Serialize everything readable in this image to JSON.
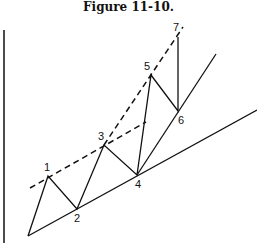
{
  "figure": {
    "title": "Figure 11-10.",
    "point_labels": [
      "1",
      "2",
      "3",
      "4",
      "5",
      "6",
      "7"
    ]
  },
  "colors": {
    "line": "#111111",
    "background": "#ffffff"
  }
}
